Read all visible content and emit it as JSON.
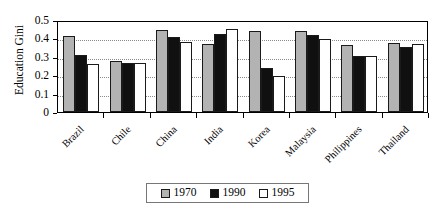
{
  "chart_data": {
    "type": "bar",
    "title": "",
    "xlabel": "",
    "ylabel": "Education Gini",
    "ylim": [
      0,
      0.5
    ],
    "ytick_labels": [
      "0",
      "0.1",
      "0.2",
      "0.3",
      "0.4",
      "0.5"
    ],
    "ytick_values": [
      0,
      0.1,
      0.2,
      0.3,
      0.4,
      0.5
    ],
    "grid": true,
    "legend_position": "bottom",
    "categories": [
      "Brazil",
      "Chile",
      "China",
      "India",
      "Korea",
      "Malaysia",
      "Philippines",
      "Thailand"
    ],
    "series": [
      {
        "name": "1970",
        "color": "#b3b3b3",
        "values": [
          0.415,
          0.275,
          0.448,
          0.37,
          0.443,
          0.443,
          0.365,
          0.375
        ]
      },
      {
        "name": "1990",
        "color": "#101010",
        "values": [
          0.312,
          0.265,
          0.41,
          0.422,
          0.24,
          0.42,
          0.305,
          0.353
        ]
      },
      {
        "name": "1995",
        "color": "#ffffff",
        "values": [
          0.26,
          0.267,
          0.378,
          0.45,
          0.195,
          0.398,
          0.305,
          0.37
        ]
      }
    ]
  }
}
